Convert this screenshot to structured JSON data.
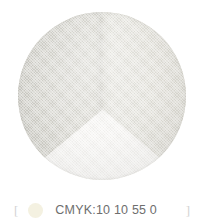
{
  "background_color": "#ffffff",
  "swatch": {
    "shape": "circle",
    "description": "interior corner render with two walls and floor",
    "faces": [
      {
        "name": "left-wall",
        "color": "#d7d6cf"
      },
      {
        "name": "right-wall",
        "color": "#e7e6df"
      },
      {
        "name": "floor",
        "color": "#f7f6f3"
      }
    ]
  },
  "caption": {
    "bracket_left": "[",
    "bracket_right": "]",
    "dot_color": "#f4f1e1",
    "cmyk_text": "CMYK:10 10 55 0",
    "text_color": "#6e6e6e"
  }
}
